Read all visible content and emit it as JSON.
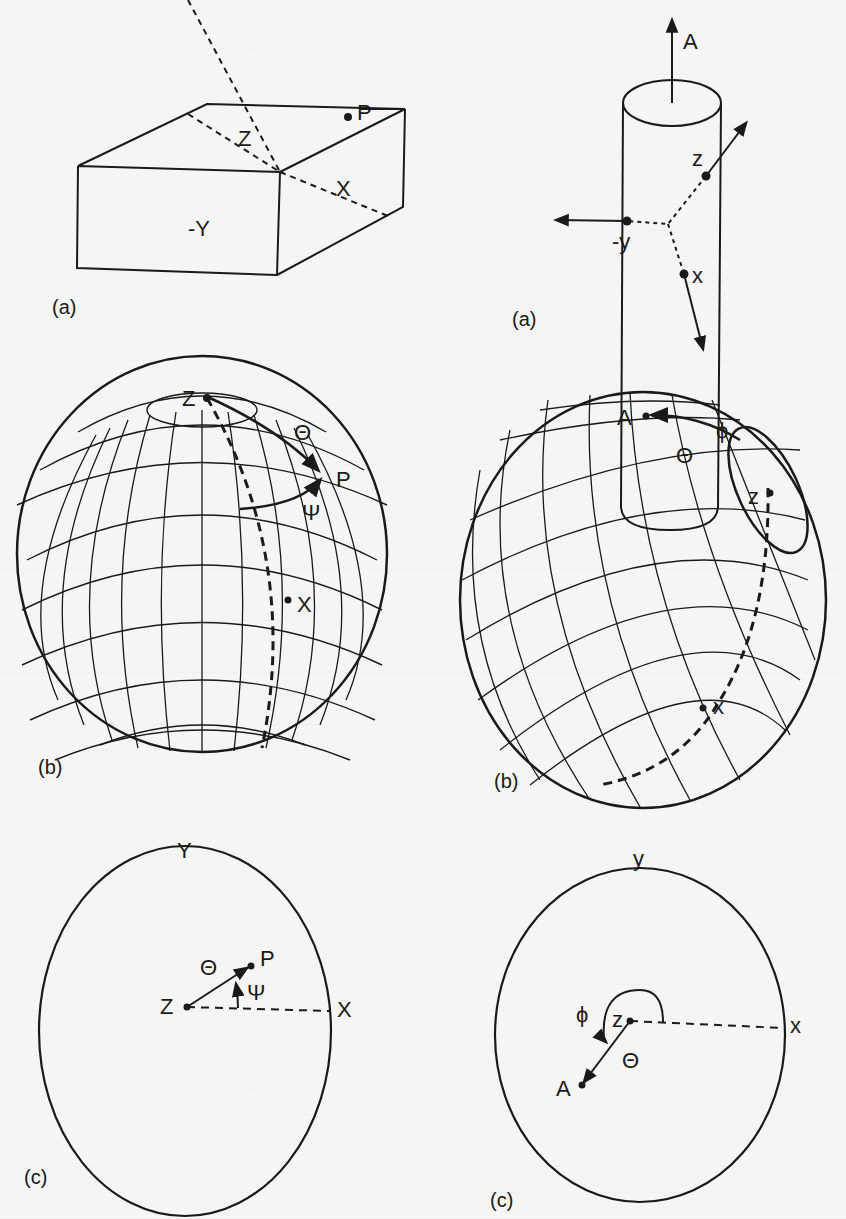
{
  "figure": {
    "left_column": {
      "panel_a": {
        "label": "(a)",
        "box_labels": {
          "z": "Z",
          "x": "X",
          "neg_y": "-Y",
          "p": "P"
        }
      },
      "panel_b": {
        "label": "(b)",
        "sphere_labels": {
          "z": "Z",
          "theta": "Θ",
          "p": "P",
          "psi": "Ψ",
          "x": "X"
        }
      },
      "panel_c": {
        "label": "(c)",
        "projection_labels": {
          "y": "Y",
          "theta": "Θ",
          "p": "P",
          "z": "Z",
          "psi": "Ψ",
          "x": "X"
        }
      }
    },
    "right_column": {
      "panel_a": {
        "label": "(a)",
        "cylinder_labels": {
          "a": "A",
          "z": "z",
          "neg_y": "-y",
          "x": "x"
        }
      },
      "panel_b": {
        "label": "(b)",
        "sphere_labels": {
          "a": "A",
          "phi": "ϕ",
          "theta": "Θ",
          "z": "z",
          "x": "x"
        }
      },
      "panel_c": {
        "label": "(c)",
        "projection_labels": {
          "y": "y",
          "phi": "ϕ",
          "z": "z",
          "x": "x",
          "theta": "Θ",
          "a": "A"
        }
      }
    },
    "colors": {
      "ink": "#1a1a1a",
      "paper": "#f5f5f3"
    }
  }
}
